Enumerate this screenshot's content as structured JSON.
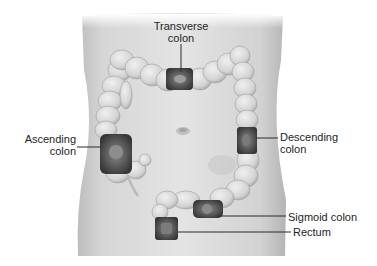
{
  "diagram": {
    "style": "grayscale medical illustration",
    "colors": {
      "background": "#ffffff",
      "torso_light": "#e2e2e2",
      "torso_mid": "#cfcfcf",
      "torso_dark": "#a9a9a9",
      "colon_fill": "#dadada",
      "colon_shadow": "#9a9a9a",
      "cutaway_dark": "#4a4a4a",
      "leader_line": "#2a2a2a",
      "text": "#1e1e1e"
    },
    "labels": [
      {
        "id": "transverse",
        "lines": [
          "Transverse",
          "colon"
        ],
        "points_to": "cutaway section of transverse colon at top center"
      },
      {
        "id": "ascending",
        "lines": [
          "Ascending",
          "colon"
        ],
        "points_to": "cutaway section of ascending colon (cecum region) at left"
      },
      {
        "id": "descending",
        "lines": [
          "Descending",
          "colon"
        ],
        "points_to": "cutaway section of descending colon at right"
      },
      {
        "id": "sigmoid",
        "lines": [
          "Sigmoid colon"
        ],
        "points_to": "cutaway section of sigmoid colon lower center"
      },
      {
        "id": "rectum",
        "lines": [
          "Rectum"
        ],
        "points_to": "cutaway section of rectum at bottom"
      }
    ],
    "other_features": [
      "navel (umbilicus) at center of abdomen",
      "appendix hanging below cecum"
    ]
  }
}
